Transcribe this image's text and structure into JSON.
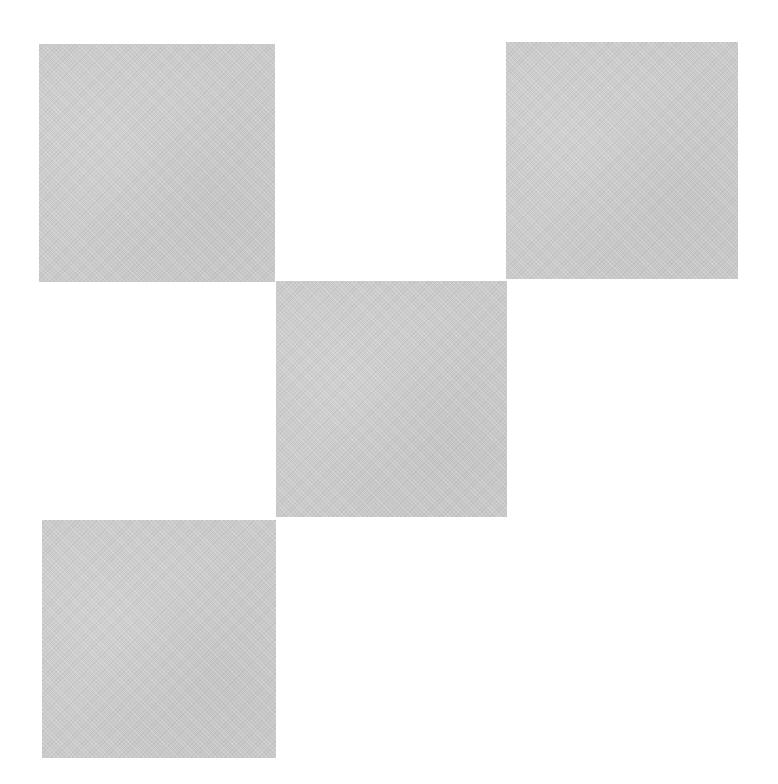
{
  "figure": {
    "background_color": "#ffffff",
    "square_color": "#cacaca",
    "squares": [
      {
        "id": "top-left",
        "x": 39,
        "y": 44,
        "width": 236,
        "height": 238
      },
      {
        "id": "top-right",
        "x": 506,
        "y": 42,
        "width": 232,
        "height": 237
      },
      {
        "id": "middle",
        "x": 276,
        "y": 281,
        "width": 231,
        "height": 236
      },
      {
        "id": "bottom-left",
        "x": 42,
        "y": 520,
        "width": 234,
        "height": 238
      }
    ]
  }
}
